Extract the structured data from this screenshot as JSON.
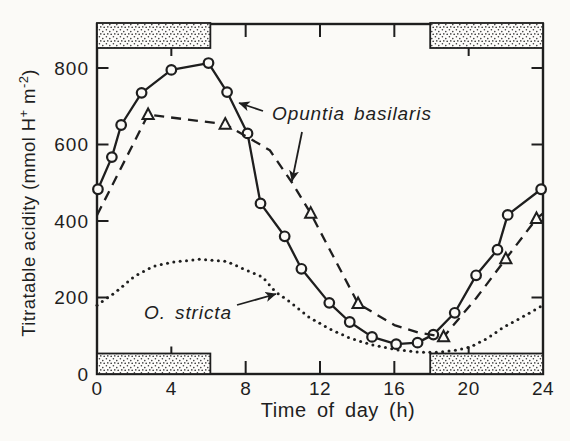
{
  "figure": {
    "background": "#fbfaf7",
    "ink": "#1e1e1e",
    "marker_fill": "#fbfaf7"
  },
  "chart_data": {
    "type": "line",
    "title": "",
    "xlabel": "Time of day (h)",
    "ylabel": "Titratable acidity (mmol H+ m-2)",
    "ylabel_parts": [
      {
        "t": "Titratable acidity (mmol H"
      },
      {
        "t": "+",
        "sup": true
      },
      {
        "t": " m",
        "sup": false
      },
      {
        "t": "-2",
        "sup": true
      },
      {
        "t": ")",
        "sup": false
      }
    ],
    "xlim": [
      0,
      24
    ],
    "ylim": [
      0,
      915
    ],
    "grid": false,
    "x_ticks": [
      0,
      4,
      8,
      12,
      16,
      20,
      24
    ],
    "long_x_ticks": [
      4,
      20
    ],
    "y_ticks": [
      0,
      200,
      400,
      600,
      800
    ],
    "legend_position": "inline-annotations",
    "dark_periods_h": [
      [
        0,
        6.1
      ],
      [
        17.93,
        24
      ]
    ],
    "series": [
      {
        "name": "Opuntia basilaris (solid line, open circles)",
        "line": "solid",
        "marker": "circle",
        "points": [
          [
            0.05,
            483
          ],
          [
            0.8,
            567
          ],
          [
            1.3,
            651
          ],
          [
            2.4,
            735
          ],
          [
            4,
            795
          ],
          [
            6,
            813
          ],
          [
            7,
            737
          ],
          [
            8.1,
            629
          ],
          [
            8.8,
            446
          ],
          [
            10.1,
            360
          ],
          [
            11,
            275
          ],
          [
            12.5,
            186
          ],
          [
            13.6,
            136
          ],
          [
            14.8,
            97
          ],
          [
            16.1,
            78
          ],
          [
            17.25,
            82
          ],
          [
            18.1,
            103
          ],
          [
            19.25,
            160
          ],
          [
            20.4,
            258
          ],
          [
            21.55,
            325
          ],
          [
            22.1,
            416
          ],
          [
            23.9,
            483
          ]
        ]
      },
      {
        "name": "Opuntia basilaris (dashed line, open triangles)",
        "line": "dashed",
        "marker": "triangle",
        "points": [
          [
            0,
            415,
            0
          ],
          [
            2.75,
            678,
            1
          ],
          [
            6.9,
            653,
            1
          ],
          [
            9.3,
            585,
            0
          ],
          [
            10.5,
            500,
            0
          ],
          [
            11.5,
            420,
            1
          ],
          [
            14.05,
            184,
            1
          ],
          [
            16,
            128,
            0
          ],
          [
            17.3,
            108,
            0
          ],
          [
            18.65,
            97,
            1
          ],
          [
            20.4,
            198,
            0
          ],
          [
            22,
            301,
            1
          ],
          [
            23.65,
            406,
            1
          ],
          [
            24,
            420,
            0
          ]
        ]
      },
      {
        "name": "O. stricta (dotted line)",
        "line": "dotted",
        "marker": "none",
        "points": [
          [
            0,
            180
          ],
          [
            1,
            214
          ],
          [
            2,
            255
          ],
          [
            3,
            281
          ],
          [
            4,
            292
          ],
          [
            5.5,
            300
          ],
          [
            7,
            294
          ],
          [
            8,
            272
          ],
          [
            8.9,
            254
          ],
          [
            9.6,
            215
          ],
          [
            10.4,
            188
          ],
          [
            11.4,
            149
          ],
          [
            12.5,
            118
          ],
          [
            13.6,
            94
          ],
          [
            14.8,
            76
          ],
          [
            16.2,
            63
          ],
          [
            17.3,
            57
          ],
          [
            18.4,
            57
          ],
          [
            19.4,
            63
          ],
          [
            20.1,
            71
          ],
          [
            21,
            93
          ],
          [
            21.9,
            123
          ],
          [
            23,
            152
          ],
          [
            24,
            180
          ]
        ]
      }
    ],
    "annotations": {
      "labels": [
        {
          "id": "opuntia-basilaris",
          "text": "Opuntia basilaris",
          "x": 272,
          "y": 120,
          "italic": true
        },
        {
          "id": "o-stricta",
          "text": "O. stricta",
          "x": 144,
          "y": 319,
          "italic": true
        }
      ],
      "arrows": [
        {
          "id": "arrow-to-solid-line",
          "x1": 263,
          "y1": 111,
          "x2": 239,
          "y2": 103
        },
        {
          "id": "arrow-to-dashed-line",
          "x1": 302,
          "y1": 132,
          "x2": 292,
          "y2": 181
        },
        {
          "id": "arrow-to-dotted-line",
          "x1": 237,
          "y1": 305,
          "x2": 276,
          "y2": 294
        }
      ]
    },
    "layout": {
      "canvas_w": 570,
      "canvas_h": 441,
      "px": {
        "left": 97,
        "right": 543,
        "top": 24,
        "bottom": 374
      },
      "x_hours": 24,
      "y_px_per_unit": 0.3825,
      "top_bar_bottom_px": 48,
      "bottom_bar_top_px": 353.5,
      "tick_len": 13,
      "y_tick_len": 11.5,
      "x_tick_label_y": 395,
      "xlabel_pos": {
        "x": 338,
        "y": 417
      },
      "ylabel_pos": {
        "x": 35,
        "y": 203
      }
    }
  }
}
